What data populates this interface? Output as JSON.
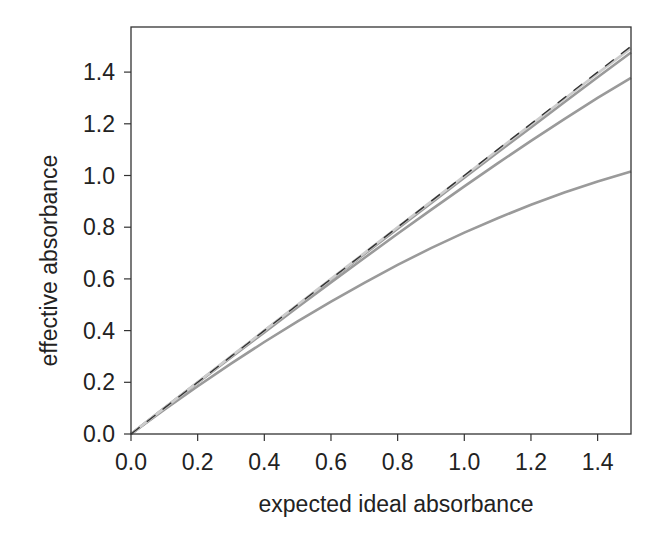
{
  "chart_data": {
    "type": "line",
    "title": "",
    "xlabel": "expected ideal absorbance",
    "ylabel": "effective absorbance",
    "xlim": [
      0,
      1.5
    ],
    "ylim": [
      0,
      1.57
    ],
    "xticks": [
      "0.0",
      "0.2",
      "0.4",
      "0.6",
      "0.8",
      "1.0",
      "1.2",
      "1.4"
    ],
    "yticks": [
      "0.0",
      "0.2",
      "0.4",
      "0.6",
      "0.8",
      "1.0",
      "1.2",
      "1.4"
    ],
    "grid": false,
    "legend": null,
    "x": [
      0,
      0.1,
      0.2,
      0.3,
      0.4,
      0.5,
      0.6,
      0.7,
      0.8,
      0.9,
      1.0,
      1.1,
      1.2,
      1.3,
      1.4,
      1.5
    ],
    "series": [
      {
        "name": "ideal (y = x)",
        "style": "dashed",
        "color": "#333333",
        "values": [
          0,
          0.1,
          0.2,
          0.3,
          0.4,
          0.5,
          0.6,
          0.7,
          0.8,
          0.9,
          1.0,
          1.1,
          1.2,
          1.3,
          1.4,
          1.5
        ]
      },
      {
        "name": "curve 1 (light)",
        "style": "solid",
        "color": "#cccccc",
        "values": [
          0,
          0.1,
          0.2,
          0.3,
          0.4,
          0.5,
          0.6,
          0.7,
          0.8,
          0.899,
          0.998,
          1.098,
          1.197,
          1.296,
          1.395,
          1.493
        ]
      },
      {
        "name": "curve 2",
        "style": "solid",
        "color": "#9a9a9a",
        "values": [
          0,
          0.1,
          0.2,
          0.299,
          0.399,
          0.498,
          0.597,
          0.696,
          0.794,
          0.893,
          0.991,
          1.089,
          1.186,
          1.283,
          1.38,
          1.476
        ]
      },
      {
        "name": "curve 3",
        "style": "solid",
        "color": "#9a9a9a",
        "values": [
          0,
          0.099,
          0.198,
          0.296,
          0.393,
          0.49,
          0.586,
          0.681,
          0.775,
          0.867,
          0.958,
          1.047,
          1.134,
          1.218,
          1.3,
          1.378
        ]
      },
      {
        "name": "curve 4",
        "style": "solid",
        "color": "#9a9a9a",
        "values": [
          0,
          0.094,
          0.185,
          0.272,
          0.356,
          0.436,
          0.512,
          0.585,
          0.654,
          0.719,
          0.779,
          0.835,
          0.887,
          0.934,
          0.977,
          1.016
        ]
      }
    ]
  }
}
